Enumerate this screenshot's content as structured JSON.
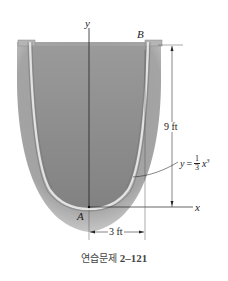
{
  "figure": {
    "labels": {
      "y_axis": "y",
      "x_axis": "x",
      "point_a": "A",
      "point_b": "B"
    },
    "dimensions": {
      "height": "9 ft",
      "half_width": "3 ft"
    },
    "equation": {
      "lhs": "y",
      "equals": "=",
      "numerator": "1",
      "denominator": "3",
      "variable": "x",
      "exponent": "3"
    },
    "caption": {
      "prefix": "연습문제",
      "number": "2–121"
    },
    "colors": {
      "liquid": "#8e8e8e",
      "wall_outer": "#a9a9a9",
      "wall_highlight": "#e6e6e6",
      "line": "#222222"
    }
  }
}
